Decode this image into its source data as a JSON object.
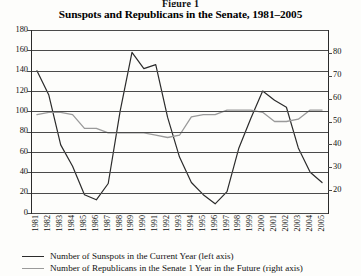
{
  "figure": {
    "label": "Figure 1",
    "title": "Sunspots and Republicans in the Senate, 1981–2005"
  },
  "colors": {
    "sunspots_line": "#2b2b2b",
    "republicans_line": "#9a9a9a",
    "gridline": "#4a4a4a",
    "axis": "#2b2b2b",
    "text": "#111111",
    "background": "#fdfdfb"
  },
  "legend": {
    "position": "below-plot",
    "entries": [
      {
        "label": "Number of Sunspots in the Current Year (left axis)",
        "color": "#2b2b2b"
      },
      {
        "label": "Number of Republicans in the Senate 1 Year in the Future (right axis)",
        "color": "#9a9a9a"
      }
    ]
  },
  "chart_data": {
    "type": "line",
    "title": "Sunspots and Republicans in the Senate, 1981–2005",
    "xlabel": "",
    "ylabel": "",
    "grid": true,
    "x": [
      1981,
      1982,
      1983,
      1984,
      1985,
      1986,
      1987,
      1988,
      1989,
      1990,
      1991,
      1992,
      1993,
      1994,
      1995,
      1996,
      1997,
      1998,
      1999,
      2000,
      2001,
      2002,
      2003,
      2004,
      2005
    ],
    "xtick_labels": [
      "1981",
      "1982",
      "1983",
      "1984",
      "1985",
      "1986",
      "1987",
      "1988",
      "1989",
      "1990",
      "1991",
      "1992",
      "1993",
      "1994",
      "1995",
      "1996",
      "1997",
      "1998",
      "1999",
      "2000",
      "2001",
      "2002",
      "2003",
      "2004",
      "2005"
    ],
    "left_axis": {
      "label": "Number of Sunspots in the Current Year",
      "ylim": [
        0,
        180
      ],
      "ticks": [
        0,
        20,
        40,
        60,
        80,
        100,
        120,
        140,
        160,
        180
      ]
    },
    "right_axis": {
      "label": "Number of Republicans in the Senate 1 Year in the Future",
      "ylim": [
        10,
        90
      ],
      "ticks": [
        20,
        30,
        40,
        50,
        60,
        70,
        80
      ]
    },
    "series": [
      {
        "name": "Number of Sunspots in the Current Year (left axis)",
        "axis": "left",
        "color": "#2b2b2b",
        "values": [
          140,
          116,
          67,
          46,
          18,
          13,
          29,
          100,
          158,
          142,
          146,
          94,
          55,
          30,
          18,
          9,
          21,
          64,
          93,
          120,
          111,
          104,
          64,
          40,
          30
        ]
      },
      {
        "name": "Number of Republicans in the Senate 1 Year in the Future (right axis)",
        "axis": "right",
        "color": "#9a9a9a",
        "values": [
          53,
          54,
          54,
          53,
          47,
          47,
          45,
          45,
          45,
          45,
          44,
          43,
          44,
          52,
          53,
          53,
          55,
          55,
          55,
          54,
          50,
          50,
          51,
          55,
          55
        ]
      }
    ]
  }
}
